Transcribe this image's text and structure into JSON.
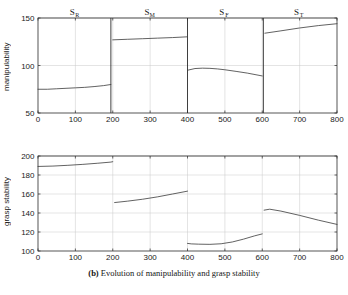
{
  "caption": {
    "prefix": "(b)",
    "text": "Evolution of manipulability and grasp stability"
  },
  "chart_data": [
    {
      "type": "line",
      "id": "manipulability",
      "title": "",
      "xlabel": "",
      "ylabel": "manipulability",
      "xlim": [
        0,
        800
      ],
      "ylim": [
        50,
        150
      ],
      "xticks": [
        0,
        100,
        200,
        300,
        400,
        500,
        600,
        700,
        800
      ],
      "yticks": [
        50,
        100,
        150
      ],
      "grid": true,
      "legend": "none",
      "phase_labels": [
        {
          "label": "S",
          "sub": "R",
          "x": 100
        },
        {
          "label": "S",
          "sub": "M",
          "x": 300
        },
        {
          "label": "S",
          "sub": "F",
          "x": 500
        },
        {
          "label": "S",
          "sub": "T",
          "x": 700
        }
      ],
      "phase_boundaries": [
        195,
        400,
        603
      ],
      "series": [
        {
          "name": "phase-SR",
          "x": [
            0,
            25,
            50,
            75,
            100,
            125,
            150,
            175,
            195
          ],
          "values": [
            75,
            75,
            75.5,
            76,
            76.5,
            77,
            77.8,
            78.8,
            80
          ]
        },
        {
          "name": "phase-SM",
          "x": [
            200,
            240,
            280,
            320,
            360,
            400
          ],
          "values": [
            127,
            127.6,
            128.2,
            128.8,
            129.4,
            130.2
          ]
        },
        {
          "name": "phase-SF",
          "x": [
            400,
            420,
            440,
            460,
            480,
            500,
            530,
            560,
            600
          ],
          "values": [
            95,
            96.8,
            97.2,
            97,
            96.4,
            95.5,
            93.8,
            92,
            89
          ]
        },
        {
          "name": "phase-ST",
          "x": [
            607,
            650,
            700,
            750,
            800
          ],
          "values": [
            134,
            136.5,
            139.5,
            142,
            144
          ]
        }
      ]
    },
    {
      "type": "line",
      "id": "grasp-stability",
      "title": "",
      "xlabel": "",
      "ylabel": "grasp stability",
      "xlim": [
        0,
        800
      ],
      "ylim": [
        100,
        200
      ],
      "xticks": [
        0,
        100,
        200,
        300,
        400,
        500,
        600,
        700,
        800
      ],
      "yticks": [
        100,
        120,
        140,
        160,
        180,
        200
      ],
      "grid": true,
      "legend": "none",
      "series": [
        {
          "name": "phase-SR",
          "x": [
            0,
            40,
            80,
            120,
            160,
            195,
            200
          ],
          "values": [
            189,
            189.4,
            190.2,
            191.2,
            192.4,
            193.6,
            194
          ]
        },
        {
          "name": "phase-SM",
          "x": [
            205,
            240,
            280,
            320,
            360,
            400
          ],
          "values": [
            151,
            152.5,
            154.5,
            157,
            160,
            163
          ]
        },
        {
          "name": "phase-SF",
          "x": [
            400,
            410,
            430,
            460,
            490,
            520,
            550,
            580,
            600
          ],
          "values": [
            108,
            107.5,
            107.2,
            107,
            107.6,
            109.5,
            112.5,
            116,
            118
          ]
        },
        {
          "name": "phase-ST",
          "x": [
            605,
            620,
            650,
            700,
            750,
            800
          ],
          "values": [
            143,
            144,
            142,
            137.5,
            132.5,
            128
          ]
        }
      ]
    }
  ]
}
